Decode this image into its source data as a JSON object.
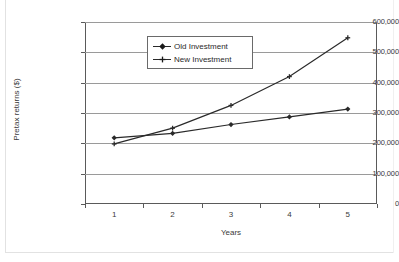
{
  "chart_data": {
    "type": "line",
    "title": "",
    "xlabel": "Years",
    "ylabel": "Pretax returns ($)",
    "categories": [
      "1",
      "2",
      "3",
      "4",
      "5"
    ],
    "ylim": [
      0,
      600000
    ],
    "ytick_labels": [
      "0",
      "100,000",
      "200,000",
      "300,000",
      "400,000",
      "500,000",
      "600,000"
    ],
    "ytick_values": [
      0,
      100000,
      200000,
      300000,
      400000,
      500000,
      600000
    ],
    "grid": "horizontal",
    "legend_position": "top-center",
    "series": [
      {
        "name": "Old Investment",
        "marker": "diamond",
        "color": "#2a2a2a",
        "values": [
          218000,
          233000,
          262000,
          287000,
          313000
        ]
      },
      {
        "name": "New Investment",
        "marker": "cross",
        "color": "#2a2a2a",
        "values": [
          198000,
          250000,
          325000,
          420000,
          548000
        ]
      }
    ]
  },
  "legend": {
    "items": [
      {
        "label": "Old Investment",
        "marker": "diamond-marker-icon"
      },
      {
        "label": "New Investment",
        "marker": "cross-marker-icon"
      }
    ]
  },
  "axes": {
    "x_title": "Years",
    "y_title": "Pretax returns ($)"
  }
}
